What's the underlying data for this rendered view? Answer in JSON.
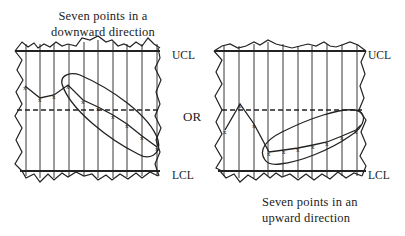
{
  "diagram": {
    "type": "control-chart-trend-rule",
    "left_chart": {
      "caption_line1": "Seven points in a",
      "caption_line2": "downward direction",
      "ucl_label": "UCL",
      "lcl_label": "LCL",
      "points_y": [
        86,
        98,
        95,
        85,
        100,
        107,
        115,
        124,
        136,
        147
      ],
      "highlighted_points": "last seven points trending down (circled)"
    },
    "separator_label": "OR",
    "right_chart": {
      "caption_line1": "Seven points in an",
      "caption_line2": "upward direction",
      "ucl_label": "UCL",
      "lcl_label": "LCL",
      "points_y": [
        130,
        104,
        124,
        152,
        150,
        148,
        145,
        142,
        136,
        130
      ],
      "highlighted_points": "last seven points trending up (circled)"
    },
    "line_color": "#222222",
    "background": "#ffffff"
  }
}
